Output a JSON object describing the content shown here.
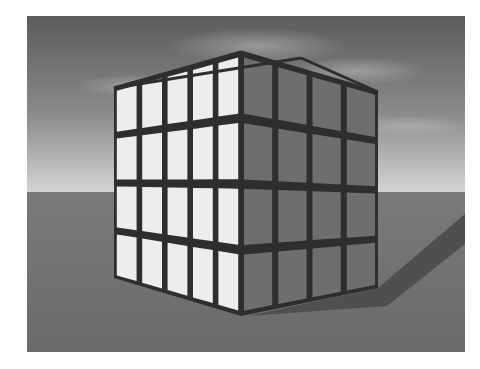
{
  "image": {
    "description": "Grayscale 3D render of a cube built from flat panels with dark structural frame, standing on a flat plane under a cloudy sky",
    "caption_partially_visible": ""
  },
  "scene": {
    "colors": {
      "sky_top": "#5c5c5c",
      "sky_mid": "#8a8a8a",
      "horizon": "#d4d4d4",
      "ground_near_horizon": "#7a7a7a",
      "ground_bottom": "#6a6a6a",
      "lit_panel": "#ededed",
      "shaded_panel": "#6e6e6e",
      "frame": "#2e2e2e",
      "shadow": "#4f4f4f"
    },
    "cube": {
      "left_face": {
        "columns": 5,
        "rows": 4
      },
      "right_face": {
        "columns": 4,
        "rows": 4
      }
    }
  }
}
